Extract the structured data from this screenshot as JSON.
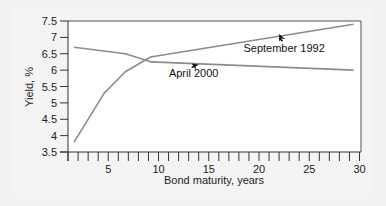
{
  "chart_data": {
    "type": "line",
    "title": "",
    "xlabel": "Bond maturity, years",
    "ylabel": "Yield, %",
    "xlim": [
      0,
      30
    ],
    "ylim": [
      3.5,
      7.5
    ],
    "x_ticks": [
      5,
      10,
      15,
      20,
      25,
      30
    ],
    "x_minor_ticks": [
      1,
      2,
      3,
      4,
      5,
      6,
      7,
      8,
      9,
      10,
      11,
      12,
      13,
      14,
      15,
      16,
      17,
      18,
      19,
      20,
      21,
      22,
      23,
      24,
      25,
      26,
      27,
      28,
      29,
      30
    ],
    "y_ticks": [
      3.5,
      4,
      4.5,
      5,
      5.5,
      6,
      6.5,
      7,
      7.5
    ],
    "y_tick_labels": [
      "3.5",
      "4",
      "4.5",
      "5",
      "5.5",
      "6",
      "6.5",
      "7",
      "7.5"
    ],
    "grid": false,
    "legend": "none (inline annotations)",
    "series": [
      {
        "name": "September 1992",
        "color": "#8c8c8c",
        "points": [
          [
            1.6,
            3.8
          ],
          [
            4.6,
            5.3
          ],
          [
            6.7,
            5.95
          ],
          [
            9.2,
            6.4
          ],
          [
            29.4,
            7.4
          ]
        ]
      },
      {
        "name": "April 2000",
        "color": "#8c8c8c",
        "points": [
          [
            1.6,
            6.7
          ],
          [
            6.7,
            6.5
          ],
          [
            9.3,
            6.25
          ],
          [
            29.4,
            6.0
          ]
        ]
      }
    ],
    "annotations": [
      {
        "text": "September 1992",
        "x": 22.5,
        "y": 6.55,
        "arrow_to": [
          22,
          7.1
        ]
      },
      {
        "text": "April 2000",
        "x": 13.5,
        "y": 5.8,
        "arrow_to": [
          13.3,
          6.2
        ]
      }
    ]
  }
}
